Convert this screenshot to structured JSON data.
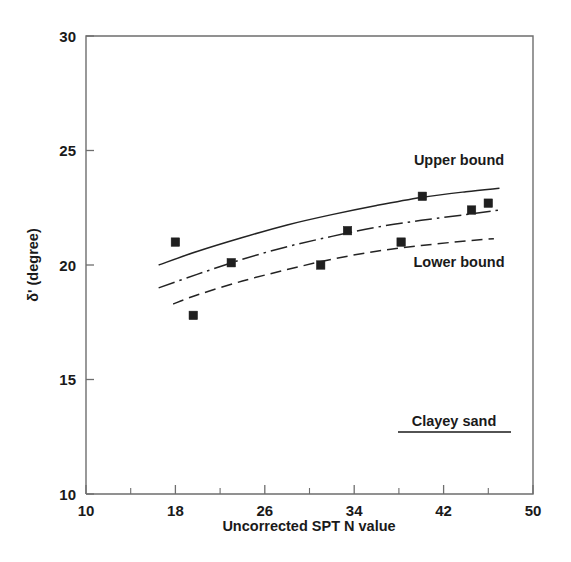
{
  "chart_data": {
    "type": "scatter",
    "title": "",
    "xlabel": "Uncorrected SPT N value",
    "ylabel": "δ' (degree)",
    "xlim": [
      10,
      50
    ],
    "ylim": [
      10,
      30
    ],
    "xticks": [
      10,
      18,
      26,
      34,
      42,
      50
    ],
    "xticklabels": [
      "10",
      "18",
      "26",
      "34",
      "42",
      "50"
    ],
    "yticks": [
      10,
      15,
      20,
      25,
      30
    ],
    "yticklabels": [
      "10",
      "15",
      "20",
      "25",
      "30"
    ],
    "x_minor_tick_step": 4,
    "grid": false,
    "legend_position": "inline-annotation",
    "annotations": [
      {
        "text": "Upper bound",
        "x": 41.5,
        "y": 24.2
      },
      {
        "text": "Lower bound",
        "x": 41.5,
        "y": 20.3
      },
      {
        "text": "Clayey sand",
        "x": 41.0,
        "y": 12.9,
        "underlined": true
      }
    ],
    "series": [
      {
        "name": "Measured data",
        "type": "scatter",
        "marker": "filled-square",
        "color": "#1f1f1f",
        "points": [
          {
            "x": 18.0,
            "y": 21.0
          },
          {
            "x": 19.6,
            "y": 17.8
          },
          {
            "x": 23.0,
            "y": 20.1
          },
          {
            "x": 31.0,
            "y": 20.0
          },
          {
            "x": 33.4,
            "y": 21.5
          },
          {
            "x": 38.2,
            "y": 21.0
          },
          {
            "x": 40.1,
            "y": 23.0
          },
          {
            "x": 44.5,
            "y": 22.4
          },
          {
            "x": 46.0,
            "y": 22.7
          }
        ]
      },
      {
        "name": "Upper bound",
        "type": "line",
        "linestyle": "solid",
        "color": "#232323",
        "points": [
          {
            "x": 16.5,
            "y": 20.0
          },
          {
            "x": 20.0,
            "y": 20.6
          },
          {
            "x": 24.0,
            "y": 21.2
          },
          {
            "x": 28.0,
            "y": 21.75
          },
          {
            "x": 32.0,
            "y": 22.2
          },
          {
            "x": 36.0,
            "y": 22.6
          },
          {
            "x": 40.0,
            "y": 22.95
          },
          {
            "x": 44.0,
            "y": 23.2
          },
          {
            "x": 47.0,
            "y": 23.35
          }
        ]
      },
      {
        "name": "Mid bound",
        "type": "line",
        "linestyle": "dash-dot",
        "color": "#232323",
        "points": [
          {
            "x": 16.5,
            "y": 19.0
          },
          {
            "x": 20.0,
            "y": 19.6
          },
          {
            "x": 24.0,
            "y": 20.25
          },
          {
            "x": 28.0,
            "y": 20.8
          },
          {
            "x": 32.0,
            "y": 21.25
          },
          {
            "x": 36.0,
            "y": 21.65
          },
          {
            "x": 40.0,
            "y": 21.95
          },
          {
            "x": 44.0,
            "y": 22.2
          },
          {
            "x": 47.0,
            "y": 22.4
          }
        ]
      },
      {
        "name": "Lower bound",
        "type": "line",
        "linestyle": "dashed",
        "color": "#232323",
        "points": [
          {
            "x": 17.8,
            "y": 18.3
          },
          {
            "x": 20.0,
            "y": 18.7
          },
          {
            "x": 24.0,
            "y": 19.3
          },
          {
            "x": 28.0,
            "y": 19.8
          },
          {
            "x": 32.0,
            "y": 20.25
          },
          {
            "x": 36.0,
            "y": 20.6
          },
          {
            "x": 40.0,
            "y": 20.85
          },
          {
            "x": 44.0,
            "y": 21.05
          },
          {
            "x": 46.5,
            "y": 21.15
          }
        ]
      }
    ]
  },
  "figure": {
    "axis_color": "#6e6e6e",
    "ink_color": "#1a1a1a",
    "background": "#ffffff"
  }
}
